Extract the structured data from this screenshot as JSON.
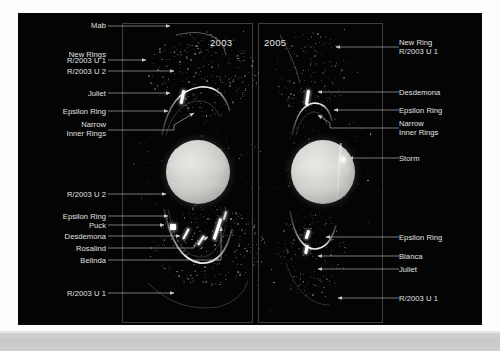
{
  "figure": {
    "kind": "astronomical-comparison-image",
    "background_color": "#040404",
    "page_color": "#fdfdfd",
    "label_color": "#e2e2e2"
  },
  "panels": [
    {
      "id": "panel-2003",
      "year": "2003",
      "year_align": "right"
    },
    {
      "id": "panel-2005",
      "year": "2005",
      "year_align": "left"
    }
  ],
  "annotations_left": [
    {
      "name": "mab",
      "text": "Mab"
    },
    {
      "name": "new-rings",
      "text": "New Rings"
    },
    {
      "name": "r-2003-u-1",
      "text": "R/2003 U 1"
    },
    {
      "name": "r-2003-u-2",
      "text": "R/2003 U 2"
    },
    {
      "name": "juliet",
      "text": "Juliet"
    },
    {
      "name": "epsilon-ring-top",
      "text": "Epsilon Ring"
    },
    {
      "name": "narrow-inner-rings-top",
      "text": "Narrow\nInner Rings"
    },
    {
      "name": "r-2003-u-2-lower",
      "text": "R/2003 U 2"
    },
    {
      "name": "epsilon-ring-lower",
      "text": "Epsilon Ring"
    },
    {
      "name": "puck",
      "text": "Puck"
    },
    {
      "name": "desdemona",
      "text": "Desdemona"
    },
    {
      "name": "rosalind",
      "text": "Rosalind"
    },
    {
      "name": "belinda",
      "text": "Belinda"
    },
    {
      "name": "r-2003-u-1-lower",
      "text": "R/2003 U 1"
    }
  ],
  "annotations_right": [
    {
      "name": "new-ring-r-2003-u-1",
      "text": "New Ring\nR/2003 U 1"
    },
    {
      "name": "desdemona",
      "text": "Desdemona"
    },
    {
      "name": "epsilon-ring-top",
      "text": "Epsilon Ring"
    },
    {
      "name": "narrow-inner-rings",
      "text": "Narrow\nInner Rings"
    },
    {
      "name": "storm",
      "text": "Storm"
    },
    {
      "name": "epsilon-ring-lower",
      "text": "Epsilon Ring"
    },
    {
      "name": "bianca",
      "text": "Bianca"
    },
    {
      "name": "juliet",
      "text": "Juliet"
    },
    {
      "name": "r-2003-u-1-lower",
      "text": "R/2003 U 1"
    }
  ]
}
